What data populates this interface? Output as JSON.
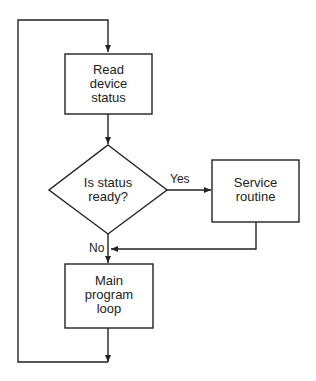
{
  "diagram": {
    "type": "flowchart",
    "nodes": {
      "read_status": {
        "shape": "process",
        "lines": [
          "Read",
          "device",
          "status"
        ]
      },
      "decision": {
        "shape": "decision",
        "lines": [
          "Is status",
          "ready?"
        ]
      },
      "service": {
        "shape": "process",
        "lines": [
          "Service",
          "routine"
        ]
      },
      "main_loop": {
        "shape": "process",
        "lines": [
          "Main",
          "program",
          "loop"
        ]
      }
    },
    "edges": [
      {
        "from": "read_status",
        "to": "decision",
        "label": ""
      },
      {
        "from": "decision",
        "to": "service",
        "label": "Yes"
      },
      {
        "from": "decision",
        "to": "main_loop",
        "label": "No"
      },
      {
        "from": "service",
        "to": "main_loop",
        "label": ""
      },
      {
        "from": "main_loop",
        "to": "read_status",
        "label": ""
      }
    ],
    "edge_labels": {
      "yes": "Yes",
      "no": "No"
    },
    "colors": {
      "stroke": "#222222",
      "background": "#ffffff"
    }
  }
}
